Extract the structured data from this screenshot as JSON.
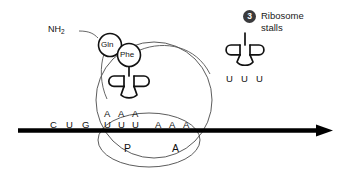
{
  "figure": {
    "background_color": "#ffffff",
    "ink_color": "#111111"
  },
  "callout": {
    "number": "3",
    "line1": "Ribosome",
    "line2": "stalls",
    "badge_color": "#3a3a3c",
    "badge_text_color": "#ffffff"
  },
  "polypeptide": {
    "terminus_label": "NH",
    "terminus_subscript": "2",
    "residues": [
      {
        "label": "Gln"
      },
      {
        "label": "Phe"
      }
    ]
  },
  "mrna": {
    "strand_color": "#000000",
    "codons_upstream": [
      "C",
      "U",
      "G"
    ],
    "codon_p_site": [
      "U",
      "U",
      "U"
    ],
    "codon_a_site": [
      "A",
      "A",
      "A"
    ],
    "sequence_text": "C U G U U U A A A"
  },
  "trna_p_site": {
    "anticodon": [
      "A",
      "A",
      "A"
    ],
    "charged_with": "Phe"
  },
  "trna_free": {
    "anticodon": [
      "U",
      "U",
      "U"
    ],
    "charged": "false"
  },
  "ribosome": {
    "large_subunit_label": "",
    "small_subunit_label": "",
    "sites": [
      {
        "name": "P",
        "label": "P"
      },
      {
        "name": "A",
        "label": "A"
      }
    ]
  }
}
